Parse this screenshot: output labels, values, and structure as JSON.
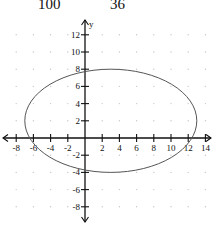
{
  "equation_fragment": {
    "denominator_x": "100",
    "denominator_y": "36"
  },
  "chart_data": {
    "type": "line",
    "title": "",
    "xlabel": "",
    "ylabel": "y",
    "xlim": [
      -9,
      15
    ],
    "ylim": [
      -10,
      14
    ],
    "grid": "dots at even integer positions",
    "x_ticks": [
      -8,
      -6,
      -4,
      -2,
      2,
      4,
      6,
      8,
      10,
      12,
      14
    ],
    "y_ticks": [
      12,
      10,
      8,
      6,
      4,
      2,
      -2,
      -4,
      -6,
      -8
    ],
    "x_tick_labels": [
      "-8",
      "-6",
      "-4",
      "-2",
      "2",
      "4",
      "6",
      "8",
      "10",
      "12",
      "14"
    ],
    "y_tick_labels": [
      "12",
      "10",
      "8",
      "6",
      "4",
      "2",
      "-2",
      "-4",
      "-6",
      "-8"
    ],
    "series": [
      {
        "name": "ellipse",
        "shape": "ellipse",
        "center": [
          3,
          2
        ],
        "semi_axis_x": 10,
        "semi_axis_y": 6,
        "vertices": [
          [
            -7,
            2
          ],
          [
            13,
            2
          ],
          [
            3,
            8
          ],
          [
            3,
            -4
          ]
        ],
        "color": "#555555"
      }
    ]
  },
  "colors": {
    "axis": "#111111",
    "ellipse": "#555555",
    "grid_dot": "#c8c8c8"
  }
}
